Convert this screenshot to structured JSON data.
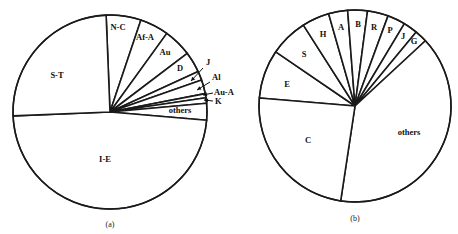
{
  "chart_data": [
    {
      "type": "pie",
      "caption": "(a)",
      "title": "",
      "geometry": {
        "cx": 110,
        "cy": 112,
        "r": 97,
        "start_angle_deg": -92.3,
        "direction": "clockwise"
      },
      "slices": [
        {
          "label": "N-C",
          "value": 5.8,
          "label_pos": [
            118,
            30
          ],
          "arrow": null
        },
        {
          "label": "Af-A",
          "value": 4.8,
          "label_pos": [
            145,
            40
          ],
          "arrow": null
        },
        {
          "label": "Au",
          "value": 4.7,
          "label_pos": [
            165,
            55
          ],
          "arrow": null
        },
        {
          "label": "D",
          "value": 3.5,
          "label_pos": [
            180,
            71
          ],
          "arrow": null
        },
        {
          "label": "J",
          "value": 1.5,
          "label_pos": [
            206,
            65
          ],
          "arrow": [
            [
              203,
              68
            ],
            [
              191,
              81
            ]
          ]
        },
        {
          "label": "Al",
          "value": 2.3,
          "label_pos": [
            212,
            80
          ],
          "arrow": [
            [
              210,
              82
            ],
            [
              197,
              90
            ]
          ]
        },
        {
          "label": "Au-A",
          "value": 0.7,
          "label_pos": [
            214,
            95
          ],
          "arrow": [
            [
              213,
              93
            ],
            [
              203,
              95
            ]
          ]
        },
        {
          "label": "K",
          "value": 0.9,
          "label_pos": [
            215,
            104
          ],
          "arrow": [
            [
              213,
              101
            ],
            [
              204,
              100
            ]
          ]
        },
        {
          "label": "others",
          "value": 2.8,
          "label_pos": [
            180,
            113
          ],
          "arrow": null
        },
        {
          "label": "I-E",
          "value": 48.0,
          "label_pos": [
            105,
            162
          ],
          "arrow": null
        },
        {
          "label": "S-T",
          "value": 25.0,
          "label_pos": [
            57,
            78
          ],
          "arrow": null
        }
      ],
      "caption_pos": [
        110,
        227
      ]
    },
    {
      "type": "pie",
      "caption": "(b)",
      "title": "",
      "geometry": {
        "cx": 355,
        "cy": 106,
        "r": 96,
        "start_angle_deg": -175.2,
        "direction": "clockwise"
      },
      "slices": [
        {
          "label": "E",
          "value": 8.2,
          "label_pos": [
            287,
            87
          ],
          "arrow": null
        },
        {
          "label": "S",
          "value": 6.4,
          "label_pos": [
            304,
            57
          ],
          "arrow": null
        },
        {
          "label": "H",
          "value": 4.6,
          "label_pos": [
            323,
            37
          ],
          "arrow": null
        },
        {
          "label": "A",
          "value": 3.2,
          "label_pos": [
            341,
            30
          ],
          "arrow": null
        },
        {
          "label": "B",
          "value": 3.3,
          "label_pos": [
            358,
            27
          ],
          "arrow": null
        },
        {
          "label": "R",
          "value": 3.5,
          "label_pos": [
            374,
            30
          ],
          "arrow": null
        },
        {
          "label": "P",
          "value": 3.0,
          "label_pos": [
            390,
            33
          ],
          "arrow": null
        },
        {
          "label": "J",
          "value": 2.4,
          "label_pos": [
            403,
            39
          ],
          "arrow": null
        },
        {
          "label": "G",
          "value": 2.1,
          "label_pos": [
            414,
            44
          ],
          "arrow": null
        },
        {
          "label": "others",
          "value": 39.2,
          "label_pos": [
            409,
            135
          ],
          "arrow": null
        },
        {
          "label": "C",
          "value": 23.9,
          "label_pos": [
            308,
            143
          ],
          "arrow": null
        }
      ],
      "caption_pos": [
        355,
        221
      ]
    }
  ]
}
